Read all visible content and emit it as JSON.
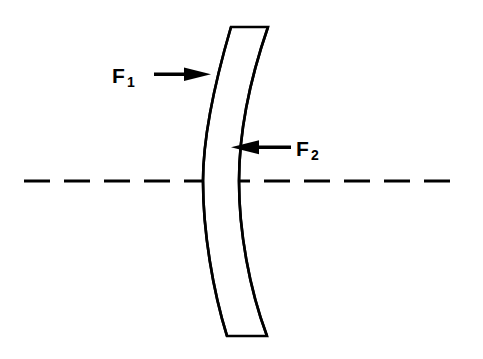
{
  "figure": {
    "background_color": "#ffffff",
    "ink_color": "#000000",
    "width": 483,
    "height": 359
  },
  "labels": {
    "f1": {
      "base": "F",
      "subscript": "1",
      "full": "F1",
      "x": 112,
      "y": 83
    },
    "f2": {
      "base": "F",
      "subscript": "2",
      "full": "F2",
      "x": 296,
      "y": 156
    }
  },
  "arrows": {
    "f1_arrow": {
      "name": "arrow-to-first-surface",
      "direction": "right",
      "tail_x": 154,
      "tip_x": 211,
      "y": 74,
      "points_to": "F1"
    },
    "f2_arrow": {
      "name": "arrow-to-second-surface",
      "direction": "left",
      "tail_x": 291,
      "tip_x": 231,
      "y": 147,
      "points_to": "F2"
    }
  },
  "optical_axis": {
    "name": "optical-axis",
    "style": "dashed",
    "y": 181,
    "x_start": 24,
    "x_end": 456,
    "dash_length": 26,
    "gap_length": 14,
    "stroke_width": 3.2
  },
  "lens": {
    "name": "meniscus-lens",
    "type": "negative-meniscus",
    "fill": "#ffffff",
    "stroke": "#000000",
    "stroke_width": 2.6,
    "top_edge": {
      "left_x": 231,
      "right_x": 268,
      "y": 27
    },
    "bottom_edge": {
      "left_x": 227,
      "right_x": 267,
      "y": 336
    },
    "first_surface": {
      "label": "F1",
      "description": "left surface, convex toward the left",
      "top": [
        231,
        27
      ],
      "vertex": [
        203,
        181
      ],
      "bottom": [
        227,
        336
      ]
    },
    "second_surface": {
      "label": "F2",
      "description": "right surface, concave toward the right",
      "top": [
        268,
        27
      ],
      "vertex": [
        228,
        181
      ],
      "bottom": [
        267,
        336
      ]
    }
  }
}
